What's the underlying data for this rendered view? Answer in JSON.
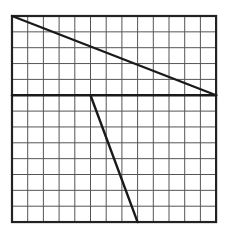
{
  "grid": {
    "columns": 13,
    "rows": 13,
    "origin_x": 12,
    "origin_y": 16,
    "cell_w": 15.7,
    "cell_h": 15.85,
    "grid_color": "#555555",
    "frame_color": "#222222"
  },
  "segments": [
    {
      "name": "diagonal-segment",
      "from": [
        0,
        0
      ],
      "to": [
        13,
        5
      ]
    },
    {
      "name": "horizontal-segment",
      "from": [
        0,
        5
      ],
      "to": [
        13,
        5
      ]
    },
    {
      "name": "steep-segment",
      "from": [
        5,
        5
      ],
      "to": [
        8,
        13
      ]
    }
  ],
  "line_color": "#1a1a1a"
}
